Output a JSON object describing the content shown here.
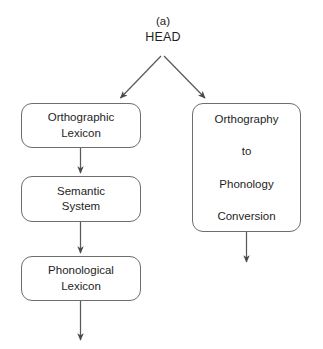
{
  "figure": {
    "caption": "(a)",
    "root_label": "HEAD"
  },
  "nodes": {
    "orthographic_lexicon": {
      "lines": [
        "Orthographic",
        "Lexicon"
      ]
    },
    "semantic_system": {
      "lines": [
        "Semantic",
        "System"
      ]
    },
    "phonological_lexicon": {
      "lines": [
        "Phonological",
        "Lexicon"
      ]
    },
    "otp_conversion": {
      "lines": [
        "Orthography",
        "to",
        "Phonology",
        "Conversion"
      ]
    }
  },
  "edges": [
    {
      "name": "head-to-orthographic-lexicon",
      "type": "diagonal-arrow"
    },
    {
      "name": "head-to-otp-conversion",
      "type": "diagonal-arrow"
    },
    {
      "name": "orthographic-lexicon-to-semantic-system",
      "type": "vertical-arrow"
    },
    {
      "name": "semantic-system-to-phonological-lexicon",
      "type": "vertical-arrow"
    },
    {
      "name": "phonological-lexicon-output",
      "type": "vertical-arrow"
    },
    {
      "name": "otp-conversion-output",
      "type": "vertical-arrow"
    }
  ],
  "style": {
    "line_color": "#5a5a5a",
    "box_border_color": "#6e6e6e",
    "text_color": "#1e1e1e",
    "background_color": "#ffffff"
  }
}
